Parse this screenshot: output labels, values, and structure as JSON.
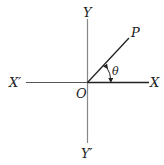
{
  "diagram": {
    "type": "coordinate-axes-angle",
    "labels": {
      "y_positive": "Y",
      "y_negative": "Y′",
      "x_positive": "X",
      "x_negative": "X′",
      "origin": "O",
      "point": "P",
      "angle": "θ"
    },
    "colors": {
      "axis_vertical": "#888888",
      "axis_horizontal": "#333333",
      "ray": "#222222",
      "text": "#222222"
    }
  }
}
